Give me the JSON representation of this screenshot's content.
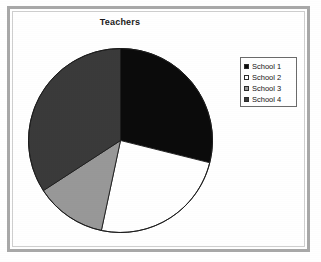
{
  "title": "Teachers",
  "colors": {
    "slice_school_1": "#0b0b0b",
    "slice_school_2": "#ffffff",
    "slice_school_3": "#989898",
    "slice_school_4": "#3a3a3a",
    "outline": "#1c1c1c",
    "frame": "#a8a8a8",
    "legend_border": "#6b6b6b",
    "background": "#ffffff"
  },
  "legend": {
    "position": "right",
    "items": [
      {
        "label": "School 1",
        "color": "#0b0b0b"
      },
      {
        "label": "School 2",
        "color": "#ffffff"
      },
      {
        "label": "School 3",
        "color": "#989898"
      },
      {
        "label": "School 4",
        "color": "#3a3a3a"
      }
    ]
  },
  "chart_data": {
    "type": "pie",
    "title": "Teachers",
    "xlabel": "",
    "ylabel": "",
    "legend_position": "right",
    "grid": false,
    "start_angle_deg": 0,
    "direction": "clockwise",
    "categories": [
      "School 1",
      "School 2",
      "School 3",
      "School 4"
    ],
    "values": [
      29,
      24,
      12.5,
      34.5
    ],
    "value_unit": "percent",
    "slices": [
      {
        "label": "School 1",
        "value": 29,
        "start_deg": 0,
        "end_deg": 104,
        "color": "#0b0b0b"
      },
      {
        "label": "School 2",
        "value": 24,
        "start_deg": 104,
        "end_deg": 192,
        "color": "#ffffff"
      },
      {
        "label": "School 3",
        "value": 12.5,
        "start_deg": 192,
        "end_deg": 237,
        "color": "#989898"
      },
      {
        "label": "School 4",
        "value": 34.5,
        "start_deg": 237,
        "end_deg": 360,
        "color": "#3a3a3a"
      }
    ]
  }
}
